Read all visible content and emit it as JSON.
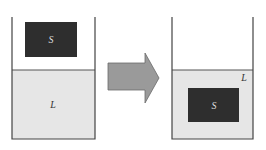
{
  "diagram": {
    "before": {
      "solid_label": "S",
      "liquid_label": "L"
    },
    "after": {
      "solid_label": "S",
      "liquid_label": "L"
    },
    "arrow": "transition-arrow"
  },
  "colors": {
    "liquid": "#e6e6e6",
    "solid": "#2e2e2e",
    "arrow_fill": "#9a9a9a",
    "arrow_stroke": "#6a6a6a",
    "wall": "#444444"
  }
}
